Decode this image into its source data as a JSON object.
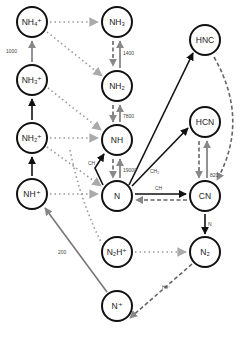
{
  "nodes": {
    "nh4p": {
      "label": "NH₄⁺",
      "x": 32,
      "y": 22
    },
    "nh3": {
      "label": "NH₃",
      "x": 117,
      "y": 22
    },
    "nh3p": {
      "label": "NH₃⁺",
      "x": 32,
      "y": 80
    },
    "nh2": {
      "label": "NH₂",
      "x": 117,
      "y": 86
    },
    "nh2p": {
      "label": "NH₂⁺",
      "x": 32,
      "y": 138
    },
    "nh": {
      "label": "NH",
      "x": 117,
      "y": 140
    },
    "nhp": {
      "label": "NH⁺",
      "x": 32,
      "y": 194
    },
    "n": {
      "label": "N",
      "x": 117,
      "y": 196
    },
    "hnc": {
      "label": "HNC",
      "x": 205,
      "y": 40
    },
    "hcn": {
      "label": "HCN",
      "x": 205,
      "y": 122
    },
    "cn": {
      "label": "CN",
      "x": 205,
      "y": 196
    },
    "n2hp": {
      "label": "N₂H⁺",
      "x": 117,
      "y": 252
    },
    "n2": {
      "label": "N₂",
      "x": 205,
      "y": 252
    },
    "np": {
      "label": "N⁺",
      "x": 117,
      "y": 306
    }
  },
  "edge_labels": {
    "nh3p_nh4p": "1000",
    "nh2_nh3": "1400",
    "nh_nh2": "7800",
    "n_nh": "19000",
    "n_nh_ch": "CH",
    "n_hnc_ch2": "CH₂",
    "n_cn_ch": "CH",
    "cn_hcn": "820",
    "cn_n2": "N",
    "np_nhp": "200",
    "n2_np": "He⁺"
  },
  "colors": {
    "solid_black": "#111111",
    "solid_gray": "#777777",
    "dotted_gray": "#999999",
    "dashed_gray": "#666666"
  }
}
